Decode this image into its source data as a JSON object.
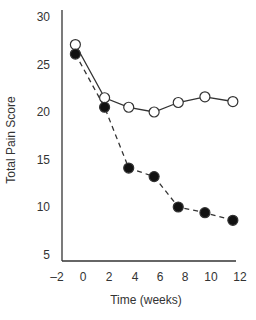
{
  "chart_data": {
    "type": "line",
    "title": "",
    "xlabel": "Time (weeks)",
    "ylabel": "Total Pain Score",
    "xlim": [
      -2,
      12
    ],
    "ylim": [
      5,
      30
    ],
    "xticks": [
      -2,
      0,
      2,
      4,
      6,
      8,
      10,
      12
    ],
    "yticks": [
      5,
      10,
      15,
      20,
      25,
      30
    ],
    "grid": false,
    "legend": null,
    "series": [
      {
        "name": "open-circles",
        "marker": "open-circle",
        "line": "solid",
        "x": [
          -0.6,
          1.7,
          3.6,
          5.6,
          7.5,
          9.6,
          11.8
        ],
        "y": [
          27.1,
          21.5,
          20.5,
          20.0,
          21.0,
          21.6,
          21.1
        ]
      },
      {
        "name": "filled-circles",
        "marker": "filled-circle",
        "line": "dashed",
        "x": [
          -0.6,
          1.7,
          3.6,
          5.6,
          7.5,
          9.6,
          11.8
        ],
        "y": [
          26.1,
          20.5,
          14.1,
          13.2,
          10.0,
          9.4,
          8.6
        ]
      }
    ]
  },
  "colors": {
    "axis": "#333333",
    "line": "#333333",
    "filled": "#111111",
    "open_fill": "#ffffff"
  }
}
